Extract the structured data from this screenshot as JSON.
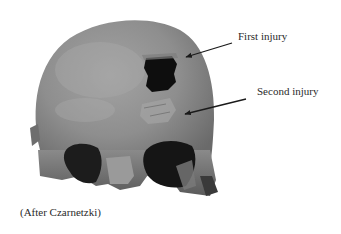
{
  "figure": {
    "annotations": [
      {
        "label": "First injury",
        "arrow": {
          "from": [
            232,
            43
          ],
          "to": [
            186,
            57
          ]
        }
      },
      {
        "label": "Second injury",
        "arrow": {
          "from": [
            246,
            99
          ],
          "to": [
            185,
            114
          ]
        }
      }
    ],
    "credit": "(After Czarnetzki)",
    "colors": {
      "background": "#ffffff",
      "bone": "#8c8c8c",
      "dark": "#141414",
      "text": "#2a2a2a"
    }
  }
}
